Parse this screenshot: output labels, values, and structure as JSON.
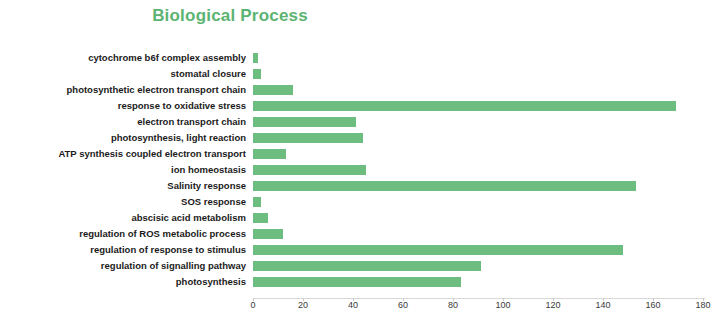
{
  "chart_data": {
    "type": "bar",
    "orientation": "horizontal",
    "title": "Biological Process",
    "xlabel": "",
    "ylabel": "",
    "xlim": [
      0,
      180
    ],
    "xticks": [
      0,
      20,
      40,
      60,
      80,
      100,
      120,
      140,
      160,
      180
    ],
    "grid": false,
    "legend": false,
    "bar_color": "#6cbd7f",
    "title_color": "#5cb472",
    "categories": [
      "cytochrome b6f complex assembly",
      "stomatal closure",
      "photosynthetic electron transport chain",
      "response to oxidative stress",
      "electron transport chain",
      "photosynthesis, light reaction",
      "ATP synthesis coupled electron transport",
      "ion homeostasis",
      "Salinity response",
      "SOS response",
      "abscisic acid metabolism",
      "regulation of ROS metabolic process",
      "regulation of response to stimulus",
      "regulation of signalling pathway",
      "photosynthesis"
    ],
    "values": [
      2,
      3,
      16,
      169,
      41,
      44,
      13,
      45,
      153,
      3,
      6,
      12,
      148,
      91,
      83
    ]
  }
}
